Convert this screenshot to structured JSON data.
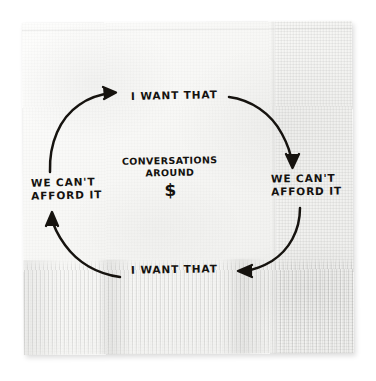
{
  "scene": {
    "medium": "photograph of a white paper napkin on a white background",
    "ink_color": "#14120f",
    "napkin_color": "#f6f6f4"
  },
  "diagram": {
    "type": "cycle",
    "direction": "counterclockwise",
    "center": {
      "line1": "CONVERSATIONS",
      "line2": "AROUND",
      "symbol": "$"
    },
    "nodes": [
      {
        "id": "top",
        "label": "I WANT THAT"
      },
      {
        "id": "right",
        "label_line1": "WE CAN'T",
        "label_line2": "AFFORD IT"
      },
      {
        "id": "bottom",
        "label": "I WANT THAT"
      },
      {
        "id": "left",
        "label_line1": "WE CAN'T",
        "label_line2": "AFFORD IT"
      }
    ],
    "arrows": [
      {
        "id": "top-right-arc",
        "from": "top",
        "to": "right",
        "head": "down"
      },
      {
        "id": "bottom-right-arc",
        "from": "right",
        "to": "bottom",
        "head": "left"
      },
      {
        "id": "bottom-left-arc",
        "from": "bottom",
        "to": "left",
        "head": "up"
      },
      {
        "id": "top-left-arc",
        "from": "left",
        "to": "top",
        "head": "up-right"
      }
    ]
  }
}
